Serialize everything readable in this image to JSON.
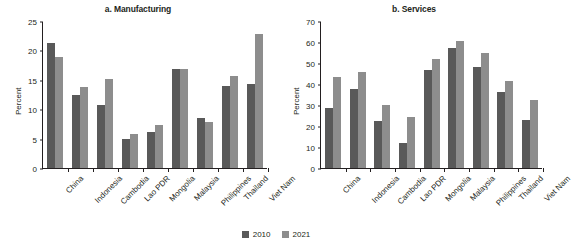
{
  "figure": {
    "legend": {
      "position": "bottom-center",
      "entries": [
        {
          "label": "2010",
          "color": "#595959"
        },
        {
          "label": "2021",
          "color": "#8d8d8d"
        }
      ]
    }
  },
  "chart_data": [
    {
      "type": "bar",
      "title": "a. Manufacturing",
      "xlabel": "",
      "ylabel": "Percent",
      "ylim": [
        0,
        25
      ],
      "yticks": [
        0,
        5,
        10,
        15,
        20,
        25
      ],
      "grid": false,
      "categories": [
        "China",
        "Indonesia",
        "Cambodia",
        "Lao PDR",
        "Mongolia",
        "Malaysia",
        "Philippines",
        "Thailand",
        "Viet Nam"
      ],
      "series": [
        {
          "name": "2010",
          "color": "#595959",
          "values": [
            21.2,
            12.4,
            10.7,
            5.0,
            6.2,
            16.8,
            8.5,
            14.0,
            14.3
          ]
        },
        {
          "name": "2021",
          "color": "#8d8d8d",
          "values": [
            18.9,
            13.8,
            15.1,
            5.8,
            7.4,
            16.8,
            7.8,
            15.7,
            22.8
          ]
        }
      ]
    },
    {
      "type": "bar",
      "title": "b. Services",
      "xlabel": "",
      "ylabel": "Percent",
      "ylim": [
        0,
        70
      ],
      "yticks": [
        0,
        10,
        20,
        30,
        40,
        50,
        60,
        70
      ],
      "grid": false,
      "categories": [
        "China",
        "Indonesia",
        "Cambodia",
        "Lao PDR",
        "Mongolia",
        "Malaysia",
        "Philippines",
        "Thailand",
        "Viet Nam"
      ],
      "series": [
        {
          "name": "2010",
          "color": "#595959",
          "values": [
            28.7,
            37.5,
            22.3,
            11.8,
            46.9,
            57.2,
            48.3,
            36.2,
            22.8
          ]
        },
        {
          "name": "2021",
          "color": "#8d8d8d",
          "values": [
            43.2,
            45.5,
            29.8,
            24.5,
            51.9,
            60.5,
            54.6,
            41.6,
            32.3
          ]
        }
      ]
    }
  ]
}
